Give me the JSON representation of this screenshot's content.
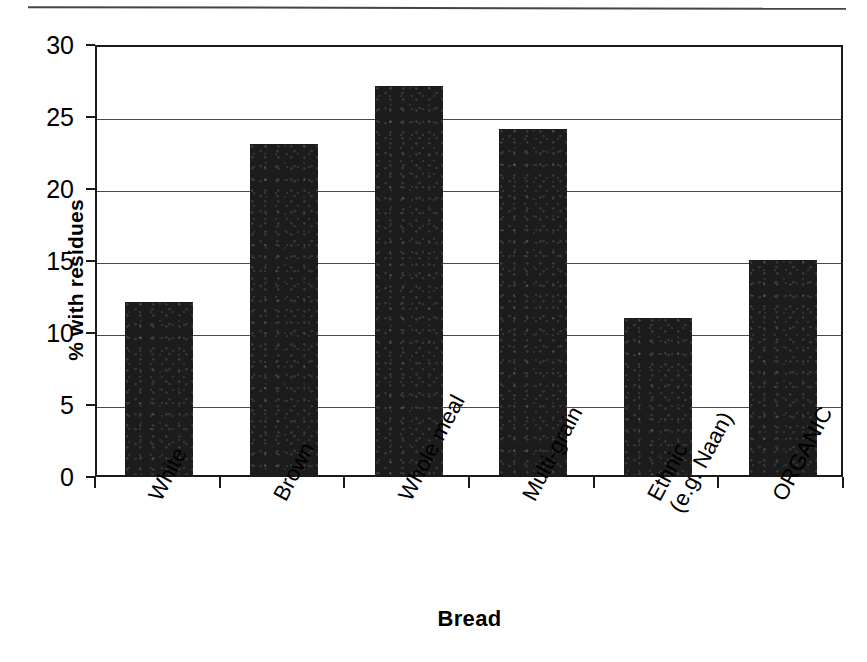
{
  "figure": {
    "page_rule": "horizontal-rule",
    "colors": {
      "bar": "#1c1c1c",
      "axis": "#1a1a1a",
      "grid": "#4a4a4a",
      "background": "#ffffff"
    }
  },
  "chart_data": {
    "type": "bar",
    "title": "",
    "xlabel": "Bread",
    "ylabel": "% with residues",
    "categories": [
      "White",
      "Brown",
      "Whole meal",
      "Multi-grain",
      "Ethnic (e.g. Naan)",
      "ORGANIC"
    ],
    "category_lines": [
      [
        "White"
      ],
      [
        "Brown"
      ],
      [
        "Whole meal"
      ],
      [
        "Multi-grain"
      ],
      [
        "Ethnic",
        "(e.g. Naan)"
      ],
      [
        "ORGANIC"
      ]
    ],
    "values": [
      12,
      23,
      27,
      24,
      10.9,
      14.9
    ],
    "ylim": [
      0,
      30
    ],
    "yticks": [
      0,
      5,
      10,
      15,
      20,
      25,
      30
    ],
    "ytick_labels": [
      "0",
      "5",
      "10",
      "15",
      "20",
      "25",
      "30"
    ],
    "grid": "horizontal",
    "legend": "none",
    "bar_color": "#1c1c1c",
    "label_rotation_deg": -62
  }
}
